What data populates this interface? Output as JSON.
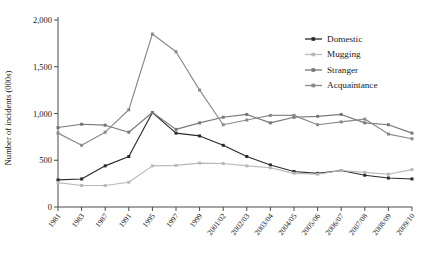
{
  "chart_data": {
    "type": "line",
    "title": "",
    "xlabel": "",
    "ylabel": "Number of incidents (000s)",
    "ylim": [
      0,
      2000
    ],
    "yticks": [
      0,
      500,
      1000,
      1500,
      2000
    ],
    "ytick_labels": [
      "0",
      "500",
      "1,000",
      "1,500",
      "2,000"
    ],
    "grid": false,
    "legend_position": "top-right",
    "categories": [
      "1981",
      "1983",
      "1987",
      "1991",
      "1995",
      "1997",
      "1999",
      "2001/02",
      "2002/03",
      "2003/04",
      "2004/05",
      "2005/06",
      "2006/07",
      "2007/08",
      "2008/09",
      "2009/10"
    ],
    "series": [
      {
        "name": "Domestic",
        "color": "#2b2b2b",
        "values": [
          290,
          300,
          440,
          540,
          1010,
          790,
          760,
          660,
          540,
          450,
          380,
          360,
          390,
          340,
          310,
          300
        ]
      },
      {
        "name": "Mugging",
        "color": "#b9b9b9",
        "values": [
          260,
          230,
          230,
          265,
          440,
          445,
          470,
          465,
          440,
          420,
          360,
          350,
          390,
          370,
          350,
          400
        ]
      },
      {
        "name": "Stranger",
        "color": "#787878",
        "values": [
          850,
          885,
          875,
          800,
          1010,
          830,
          900,
          960,
          990,
          900,
          960,
          970,
          990,
          900,
          880,
          790
        ]
      },
      {
        "name": "Acquaintance",
        "color": "#8a8a8a",
        "values": [
          790,
          660,
          800,
          1040,
          1850,
          1660,
          1250,
          880,
          930,
          980,
          980,
          880,
          910,
          940,
          780,
          730
        ]
      }
    ]
  }
}
